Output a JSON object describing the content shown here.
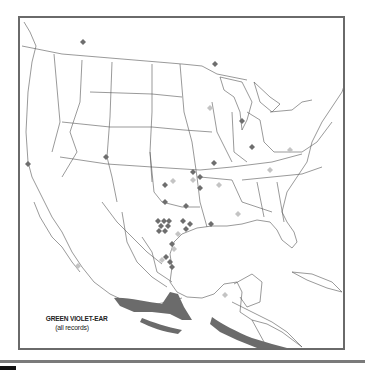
{
  "map": {
    "title": "GREEN VIOLET-EAR",
    "subtitle": "(all records)",
    "colors": {
      "frame": "#6a6a6a",
      "borders": "#555555",
      "range": "#6b6b6b",
      "record_dark": "#6e6e6e",
      "record_light": "#c4c4c4"
    },
    "records_dark": [
      [
        81,
        40
      ],
      [
        213,
        62
      ],
      [
        26,
        162
      ],
      [
        104,
        155
      ],
      [
        240,
        119
      ],
      [
        250,
        145
      ],
      [
        212,
        161
      ],
      [
        191,
        170
      ],
      [
        198,
        175
      ],
      [
        198,
        186
      ],
      [
        163,
        183
      ],
      [
        163,
        200
      ],
      [
        184,
        204
      ],
      [
        156,
        219
      ],
      [
        162,
        219
      ],
      [
        167,
        219
      ],
      [
        159,
        224
      ],
      [
        166,
        224
      ],
      [
        157,
        229
      ],
      [
        163,
        229
      ],
      [
        181,
        219
      ],
      [
        188,
        222
      ],
      [
        184,
        227
      ],
      [
        209,
        222
      ],
      [
        170,
        242
      ],
      [
        164,
        255
      ],
      [
        168,
        260
      ],
      [
        170,
        265
      ]
    ],
    "records_light": [
      [
        208,
        106
      ],
      [
        288,
        148
      ],
      [
        268,
        168
      ],
      [
        171,
        179
      ],
      [
        217,
        183
      ],
      [
        191,
        178
      ],
      [
        236,
        212
      ],
      [
        176,
        232
      ],
      [
        172,
        247
      ],
      [
        160,
        258
      ],
      [
        76,
        264
      ],
      [
        223,
        293
      ]
    ]
  },
  "page": {
    "rule_color": "#7a7a7a"
  }
}
